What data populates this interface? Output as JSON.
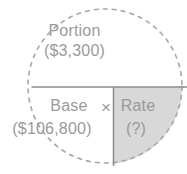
{
  "diagram": {
    "colors": {
      "text": "#9a9a9a",
      "shaded_quadrant": "#d8d8d8",
      "circle_stroke": "#a8a8a8",
      "divider_stroke": "#8d8d8d",
      "background": "#ffffff"
    },
    "circle": {
      "center_x": 105,
      "center_y": 86,
      "radius": 77,
      "stroke_style": "dashed",
      "dash_length": 5,
      "dash_gap": 4
    },
    "upper_half": {
      "label": "Portion",
      "value": "($3,300)"
    },
    "lower_half": {
      "left_cell": {
        "label": "Base",
        "value": "($106,800)",
        "shaded": false
      },
      "operator": "×",
      "right_cell": {
        "label": "Rate",
        "value": "(?)",
        "shaded": true
      }
    }
  }
}
